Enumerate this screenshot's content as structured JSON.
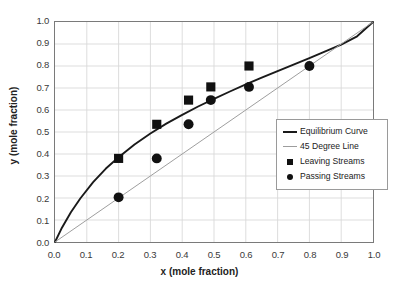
{
  "chart_data": {
    "type": "line",
    "title": "",
    "xlabel": "x (mole fraction)",
    "ylabel": "y (mole fraction)",
    "xlim": [
      0.0,
      1.0
    ],
    "ylim": [
      0.0,
      1.0
    ],
    "grid": true,
    "legend_position": "center-right",
    "xticks": [
      "0.0",
      "0.1",
      "0.2",
      "0.3",
      "0.4",
      "0.5",
      "0.6",
      "0.7",
      "0.8",
      "0.9",
      "1.0"
    ],
    "yticks": [
      "0.0",
      "0.1",
      "0.2",
      "0.3",
      "0.4",
      "0.5",
      "0.6",
      "0.7",
      "0.8",
      "0.9",
      "1.0"
    ],
    "xtick_values": [
      0.0,
      0.1,
      0.2,
      0.3,
      0.4,
      0.5,
      0.6,
      0.7,
      0.8,
      0.9,
      1.0
    ],
    "ytick_values": [
      0.0,
      0.1,
      0.2,
      0.3,
      0.4,
      0.5,
      0.6,
      0.7,
      0.8,
      0.9,
      1.0
    ],
    "series": [
      {
        "name": "Equilibrium Curve",
        "type": "line",
        "color": "#1a1a1a",
        "width": 1.9,
        "x": [
          0.0,
          0.02,
          0.05,
          0.08,
          0.12,
          0.16,
          0.2,
          0.25,
          0.3,
          0.35,
          0.4,
          0.45,
          0.5,
          0.55,
          0.6,
          0.65,
          0.7,
          0.75,
          0.8,
          0.85,
          0.9,
          0.95,
          1.0
        ],
        "y": [
          0.0,
          0.06,
          0.135,
          0.199,
          0.272,
          0.334,
          0.385,
          0.443,
          0.493,
          0.538,
          0.578,
          0.616,
          0.651,
          0.684,
          0.716,
          0.747,
          0.777,
          0.806,
          0.836,
          0.866,
          0.897,
          0.935,
          1.0
        ]
      },
      {
        "name": "45 Degree Line",
        "type": "line",
        "color": "#9d9d9d",
        "width": 1.0,
        "x": [
          0.0,
          1.0
        ],
        "y": [
          0.0,
          1.0
        ]
      },
      {
        "name": "Leaving Streams",
        "type": "scatter",
        "marker": "square",
        "color": "#111111",
        "x": [
          0.2,
          0.32,
          0.42,
          0.49,
          0.61
        ],
        "y": [
          0.38,
          0.535,
          0.645,
          0.705,
          0.8
        ]
      },
      {
        "name": "Passing Streams",
        "type": "scatter",
        "marker": "circle",
        "color": "#111111",
        "x": [
          0.2,
          0.32,
          0.42,
          0.49,
          0.61,
          0.8
        ],
        "y": [
          0.203,
          0.38,
          0.535,
          0.645,
          0.705,
          0.8
        ]
      }
    ]
  },
  "legend": {
    "items": [
      {
        "label": "Equilibrium Curve",
        "key": "line-thick"
      },
      {
        "label": "45 Degree Line",
        "key": "line-thin"
      },
      {
        "label": "Leaving Streams",
        "key": "square-marker"
      },
      {
        "label": "Passing Streams",
        "key": "circle-marker"
      }
    ]
  },
  "colors": {
    "equilibrium": "#1a1a1a",
    "diagonal": "#9d9d9d",
    "marker": "#111111",
    "grid": "#d9d9d9",
    "frame": "#7a7a7a",
    "text": "#3a3a3a",
    "background": "#ffffff"
  }
}
